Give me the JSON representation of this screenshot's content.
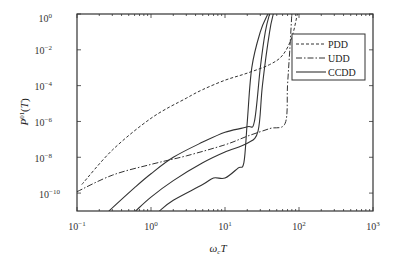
{
  "chart_data": {
    "type": "line",
    "title": "",
    "xlabel": "ω_c T",
    "ylabel": "P^{01}(T)",
    "xscale": "log",
    "yscale": "log",
    "xlim": [
      0.1,
      1000
    ],
    "ylim": [
      1e-11,
      1
    ],
    "x_ticks": [
      "10^-1",
      "10^0",
      "10^1",
      "10^2",
      "10^3"
    ],
    "y_ticks": [
      "10^0",
      "10^-2",
      "10^-4",
      "10^-6",
      "10^-8",
      "10^-10"
    ],
    "grid": false,
    "legend_position": "upper right",
    "series": [
      {
        "name": "PDD",
        "style": "dashed",
        "points": [
          [
            0.116,
            3e-10
          ],
          [
            0.3,
            2.5e-08
          ],
          [
            1.0,
            1.5e-06
          ],
          [
            3.0,
            2e-05
          ],
          [
            5.0,
            6e-05
          ],
          [
            10.0,
            0.0002
          ],
          [
            20.0,
            0.0005
          ],
          [
            40.0,
            0.0015
          ],
          [
            60.0,
            0.005
          ],
          [
            80.0,
            0.05
          ],
          [
            95.0,
            1.0
          ]
        ]
      },
      {
        "name": "UDD",
        "style": "dash-dot",
        "points": [
          [
            0.1,
            1.2e-10
          ],
          [
            0.3,
            1e-09
          ],
          [
            1.0,
            4e-09
          ],
          [
            3.0,
            1.2e-08
          ],
          [
            10.0,
            5e-08
          ],
          [
            20.0,
            1.5e-07
          ],
          [
            40.0,
            4e-07
          ],
          [
            65.0,
            8e-07
          ],
          [
            70.0,
            0.0001
          ],
          [
            75.0,
            0.01
          ],
          [
            80.0,
            1.0
          ]
        ]
      },
      {
        "name": "CCDD (1)",
        "style": "solid",
        "points": [
          [
            0.27,
            1e-11
          ],
          [
            0.6,
            2e-10
          ],
          [
            1.0,
            1.2e-09
          ],
          [
            2.0,
            1e-08
          ],
          [
            5.0,
            7e-08
          ],
          [
            10.0,
            2.5e-07
          ],
          [
            20.0,
            5e-07
          ],
          [
            25.0,
            1e-06
          ],
          [
            30.0,
            0.001
          ],
          [
            35.0,
            0.1
          ],
          [
            40.0,
            1.0
          ]
        ]
      },
      {
        "name": "CCDD (2)",
        "style": "solid",
        "points": [
          [
            0.62,
            1e-11
          ],
          [
            1.0,
            6e-11
          ],
          [
            2.0,
            5e-10
          ],
          [
            5.0,
            5e-09
          ],
          [
            10.0,
            2e-08
          ],
          [
            20.0,
            6e-08
          ],
          [
            28.0,
            3e-07
          ],
          [
            32.0,
            0.0001
          ],
          [
            40.0,
            0.1
          ],
          [
            45.0,
            1.0
          ]
        ]
      },
      {
        "name": "CCDD (3)",
        "style": "solid",
        "points": [
          [
            1.3,
            1e-11
          ],
          [
            2.0,
            4e-11
          ],
          [
            5.0,
            3e-10
          ],
          [
            7.0,
            7e-10
          ],
          [
            10.0,
            7e-10
          ],
          [
            15.0,
            2.5e-09
          ],
          [
            18.0,
            5e-09
          ],
          [
            20.0,
            1e-06
          ],
          [
            23.0,
            0.001
          ],
          [
            30.0,
            0.1
          ],
          [
            38.0,
            1.0
          ]
        ]
      }
    ],
    "legend": [
      "PDD",
      "UDD",
      "CCDD"
    ]
  },
  "axes": {
    "xlabel": "ωcT",
    "ylabel": "P01(T)",
    "x_tick_labels": [
      {
        "base": "10",
        "exp": "−1"
      },
      {
        "base": "10",
        "exp": "0"
      },
      {
        "base": "10",
        "exp": "1"
      },
      {
        "base": "10",
        "exp": "2"
      },
      {
        "base": "10",
        "exp": "3"
      }
    ],
    "y_tick_labels": [
      {
        "base": "10",
        "exp": "0"
      },
      {
        "base": "10",
        "exp": "−2"
      },
      {
        "base": "10",
        "exp": "−4"
      },
      {
        "base": "10",
        "exp": "−6"
      },
      {
        "base": "10",
        "exp": "−8"
      },
      {
        "base": "10",
        "exp": "−10"
      }
    ]
  },
  "legend": {
    "items": [
      {
        "label": "PDD",
        "style": "dashed"
      },
      {
        "label": "UDD",
        "style": "dash-dot"
      },
      {
        "label": "CCDD",
        "style": "solid"
      }
    ]
  },
  "colors": {
    "line": "#333333",
    "axis": "#333333",
    "background": "#ffffff"
  }
}
